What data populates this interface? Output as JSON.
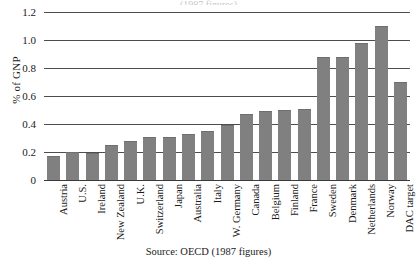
{
  "chart_data": {
    "type": "bar",
    "title": "",
    "clipped_title": "(1987 figures)",
    "xlabel": "",
    "ylabel": "% of GNP",
    "ylim": [
      0,
      1.2
    ],
    "yticks": [
      "1.2",
      "1.0",
      "0.8",
      "0.6",
      "0.4",
      "0.2",
      "0"
    ],
    "ytick_values": [
      1.2,
      1.0,
      0.8,
      0.6,
      0.4,
      0.2,
      0
    ],
    "grid": true,
    "legend": "none",
    "source": "Source: OECD (1987 figures)",
    "bar_color": "#808080",
    "categories": [
      "Austria",
      "U.S.",
      "Ireland",
      "New Zealand",
      "U.K.",
      "Switzerland",
      "Japan",
      "Australia",
      "Italy",
      "W. Germany",
      "Canada",
      "Belgium",
      "Finland",
      "France",
      "Sweden",
      "Denmark",
      "Netherlands",
      "Norway",
      "DAC target"
    ],
    "values": [
      0.17,
      0.2,
      0.19,
      0.25,
      0.28,
      0.31,
      0.31,
      0.33,
      0.35,
      0.39,
      0.47,
      0.49,
      0.5,
      0.51,
      0.88,
      0.88,
      0.98,
      1.1,
      0.7
    ]
  }
}
